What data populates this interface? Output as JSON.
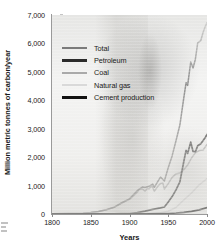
{
  "chart_data": {
    "type": "line",
    "title": "",
    "xlabel": "Years",
    "ylabel": "Million metric tonnes of carbon/year",
    "xlim": [
      1800,
      2000
    ],
    "ylim": [
      0,
      7000
    ],
    "xticks": [
      "1800",
      "1850",
      "1900",
      "1950",
      "2000"
    ],
    "yticks": [
      "0",
      "1,000",
      "2,000",
      "3,000",
      "4,000",
      "5,000",
      "6,000",
      "7,000"
    ],
    "grid": false,
    "legend_position": "upper-left-inside",
    "series": [
      {
        "name": "Total",
        "color": "#7b7b7b",
        "x": [
          1800,
          1820,
          1840,
          1850,
          1860,
          1870,
          1880,
          1890,
          1900,
          1910,
          1917,
          1920,
          1925,
          1930,
          1932,
          1937,
          1940,
          1945,
          1950,
          1955,
          1960,
          1965,
          1970,
          1973,
          1975,
          1979,
          1982,
          1985,
          1988,
          1992,
          1995,
          1998,
          2000
        ],
        "values": [
          8,
          15,
          30,
          54,
          91,
          147,
          236,
          396,
          534,
          819,
          950,
          932,
          975,
          1053,
          938,
          1163,
          1299,
          1160,
          1630,
          2043,
          2577,
          3129,
          4076,
          4617,
          4525,
          5347,
          5136,
          5444,
          6018,
          6101,
          6393,
          6610,
          6735
        ]
      },
      {
        "name": "Petroleum",
        "color": "#2b2b2b",
        "x": [
          1800,
          1870,
          1880,
          1890,
          1900,
          1910,
          1920,
          1930,
          1940,
          1945,
          1950,
          1955,
          1960,
          1965,
          1970,
          1973,
          1975,
          1979,
          1982,
          1985,
          1988,
          1992,
          1995,
          1998,
          2000
        ],
        "values": [
          0,
          1,
          4,
          10,
          18,
          49,
          100,
          165,
          215,
          247,
          423,
          612,
          849,
          1130,
          1838,
          2240,
          2131,
          2529,
          2200,
          2186,
          2399,
          2472,
          2585,
          2701,
          2800
        ]
      },
      {
        "name": "Coal",
        "color": "#a9a9a9",
        "x": [
          1800,
          1820,
          1840,
          1850,
          1860,
          1870,
          1880,
          1890,
          1900,
          1910,
          1913,
          1917,
          1920,
          1923,
          1925,
          1929,
          1932,
          1937,
          1940,
          1943,
          1945,
          1950,
          1955,
          1960,
          1965,
          1970,
          1975,
          1980,
          1985,
          1990,
          1995,
          2000
        ],
        "values": [
          8,
          15,
          30,
          54,
          91,
          146,
          232,
          385,
          515,
          766,
          890,
          880,
          800,
          902,
          883,
          994,
          800,
          990,
          1070,
          1090,
          880,
          1070,
          1290,
          1410,
          1440,
          1560,
          1720,
          1970,
          2150,
          2230,
          2250,
          2450
        ]
      },
      {
        "name": "Natural gas",
        "color": "#d3d3d3",
        "x": [
          1800,
          1890,
          1900,
          1910,
          1920,
          1930,
          1940,
          1950,
          1960,
          1970,
          1980,
          1990,
          2000
        ],
        "values": [
          0,
          1,
          2,
          5,
          13,
          27,
          44,
          97,
          227,
          493,
          738,
          1026,
          1250
        ]
      },
      {
        "name": "Cement production",
        "color": "#111111",
        "x": [
          1800,
          1900,
          1920,
          1940,
          1950,
          1960,
          1970,
          1980,
          1990,
          2000
        ],
        "values": [
          0,
          2,
          5,
          10,
          18,
          35,
          60,
          95,
          145,
          226
        ]
      }
    ]
  },
  "axis": {
    "y_title": "Million metric tonnes of carbon/year",
    "x_title": "Years"
  },
  "legend": {
    "items": [
      {
        "label": "Total",
        "color": "#7b7b7b"
      },
      {
        "label": "Petroleum",
        "color": "#2b2b2b"
      },
      {
        "label": "Coal",
        "color": "#a9a9a9"
      },
      {
        "label": "Natural gas",
        "color": "#d9d9d9"
      },
      {
        "label": "Cement production",
        "color": "#111111"
      }
    ]
  }
}
